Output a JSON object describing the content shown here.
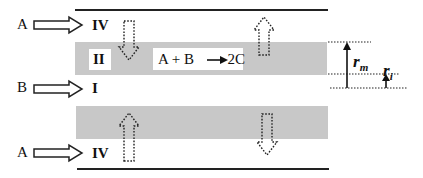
{
  "diagram": {
    "type": "membrane reactor schematic (cross-section)",
    "inlets": [
      {
        "species": "A",
        "region": "IV",
        "position": "top"
      },
      {
        "species": "B",
        "region": "I",
        "position": "middle"
      },
      {
        "species": "A",
        "region": "IV",
        "position": "bottom"
      }
    ],
    "regions": {
      "membrane": "II",
      "core": "I",
      "shell": "IV"
    },
    "reaction": {
      "lhs_a": "A",
      "plus": "+",
      "lhs_b": "B",
      "rhs": "2C"
    },
    "dimensions": {
      "outer_radius_symbol": "r",
      "outer_radius_sub": "m",
      "inner_radius_symbol": "r",
      "inner_radius_sub": "i"
    },
    "flux_arrows": [
      {
        "location": "top-left",
        "direction": "down"
      },
      {
        "location": "top-right",
        "direction": "up"
      },
      {
        "location": "bottom-left",
        "direction": "up"
      },
      {
        "location": "bottom-right",
        "direction": "down"
      }
    ],
    "colors": {
      "membrane_fill": "#c8c8c8",
      "line": "#222222",
      "background": "#ffffff"
    }
  }
}
